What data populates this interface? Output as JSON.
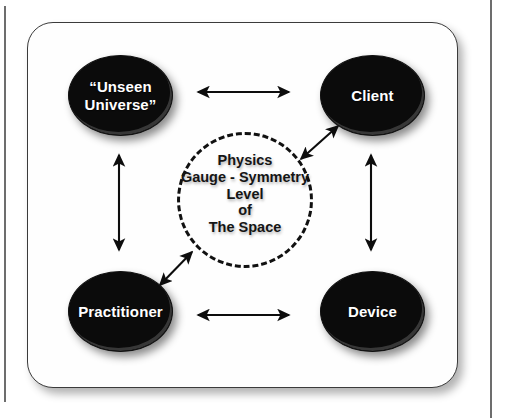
{
  "figure": {
    "type": "relationship-diagram",
    "nodes": [
      {
        "id": "unseen-universe",
        "label": "“Unseen\nUniverse”",
        "position": "top-left"
      },
      {
        "id": "client",
        "label": "Client",
        "position": "top-right"
      },
      {
        "id": "practitioner",
        "label": "Practitioner",
        "position": "bottom-left"
      },
      {
        "id": "device",
        "label": "Device",
        "position": "bottom-right"
      }
    ],
    "center": {
      "id": "gauge-symmetry-space",
      "shape": "dashed-circle",
      "lines": [
        "Physics",
        "Gauge - Symmetry",
        "Level",
        "of",
        "The Space"
      ]
    },
    "connections": [
      {
        "id": "unseen-client",
        "from": "unseen-universe",
        "to": "client",
        "style": "double-arrow",
        "orientation": "horizontal"
      },
      {
        "id": "unseen-practitioner",
        "from": "unseen-universe",
        "to": "practitioner",
        "style": "double-arrow",
        "orientation": "vertical"
      },
      {
        "id": "client-device",
        "from": "client",
        "to": "device",
        "style": "double-arrow",
        "orientation": "vertical"
      },
      {
        "id": "practitioner-device",
        "from": "practitioner",
        "to": "device",
        "style": "double-arrow",
        "orientation": "horizontal"
      },
      {
        "id": "center-client",
        "from": "gauge-symmetry-space",
        "to": "client",
        "style": "double-arrow",
        "orientation": "diagonal-up-right"
      },
      {
        "id": "center-practitioner",
        "from": "gauge-symmetry-space",
        "to": "practitioner",
        "style": "double-arrow",
        "orientation": "diagonal-down-left"
      }
    ],
    "colors": {
      "node_fill": "#0b0b0b",
      "node_text": "#ffffff",
      "center_text": "#151515",
      "frame_border": "#3b3b3b",
      "background": "#ffffff",
      "arrow": "#0d0d0d"
    }
  }
}
